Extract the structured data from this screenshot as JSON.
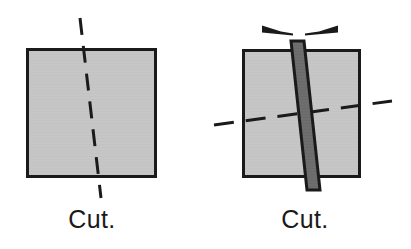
{
  "figure": {
    "background_color": "#ffffff",
    "panels": [
      {
        "id": "left-panel",
        "caption": "Cut.",
        "caption_position": {
          "x": 92,
          "y": 228
        },
        "square": {
          "name": "material-block",
          "x": 26,
          "y": 48,
          "width": 131,
          "height": 130,
          "fill_color": "#c6c6c6",
          "stroke_color": "#1a1a1a",
          "stroke_width": 3
        },
        "cut_line": {
          "name": "cut-line-vertical",
          "style": "dashed",
          "orientation": "near-vertical",
          "x1": 80,
          "y1": 18,
          "x2": 101,
          "y2": 198,
          "color": "#1a1a1a",
          "width": 3,
          "dash": "17 11"
        },
        "blade": null,
        "arrows": []
      },
      {
        "id": "right-panel",
        "caption": "Cut.",
        "caption_position": {
          "x": 305,
          "y": 228
        },
        "square": {
          "name": "material-block",
          "x": 242,
          "y": 49,
          "width": 119,
          "height": 129,
          "fill_color": "#c6c6c6",
          "stroke_color": "#1a1a1a",
          "stroke_width": 3
        },
        "cut_line": {
          "name": "cut-line-horizontal",
          "style": "dashed",
          "orientation": "near-horizontal",
          "x1": 214,
          "y1": 125,
          "x2": 392,
          "y2": 101,
          "color": "#1a1a1a",
          "width": 3,
          "dash": "20 12"
        },
        "blade": {
          "name": "blade-bar",
          "description": "tilted rectangular blade crossing the block",
          "top_x": 297,
          "top_y": 41,
          "bottom_x": 313,
          "bottom_y": 190,
          "thickness": 13,
          "fill_color": "#6e6e6e",
          "stroke_color": "#1a1a1a",
          "stroke_width": 3
        },
        "arrows": [
          {
            "name": "arrow-left",
            "direction": "left",
            "tip_x": 262,
            "tip_y": 28,
            "tail_x": 293,
            "tail_y": 34,
            "color": "#1a1a1a"
          },
          {
            "name": "arrow-right",
            "direction": "right",
            "tip_x": 338,
            "tip_y": 28,
            "tail_x": 303,
            "tail_y": 34,
            "color": "#1a1a1a"
          }
        ]
      }
    ]
  }
}
